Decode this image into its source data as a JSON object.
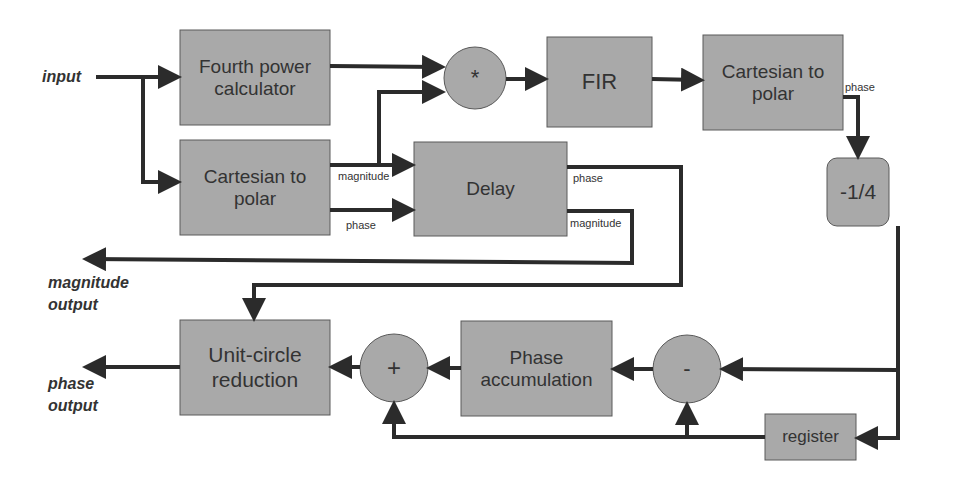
{
  "diagram": {
    "io_labels": {
      "input": "input",
      "magnitude_output": "magnitude\noutput",
      "magnitude_output_line1": "magnitude",
      "magnitude_output_line2": "output",
      "phase_output_line1": "phase",
      "phase_output_line2": "output"
    },
    "blocks": {
      "fourth_power": "Fourth power calculator",
      "cart_to_polar_left": "Cartesian to polar",
      "multiply": "*",
      "fir": "FIR",
      "cart_to_polar_right": "Cartesian to polar",
      "delay": "Delay",
      "scale": "-1/4",
      "unit_circle": "Unit-circle reduction",
      "adder": "+",
      "phase_accumulation": "Phase accumulation",
      "subtractor": "-",
      "register": "register"
    },
    "signal_labels": {
      "left_magnitude": "magnitude",
      "left_phase": "phase",
      "delay_phase": "phase",
      "delay_magnitude": "magnitude",
      "right_phase": "phase"
    },
    "colors": {
      "block_fill": "#a9a9a9",
      "block_border": "#5a5a5a",
      "wire": "#2b2b2b",
      "text": "#333333"
    }
  }
}
